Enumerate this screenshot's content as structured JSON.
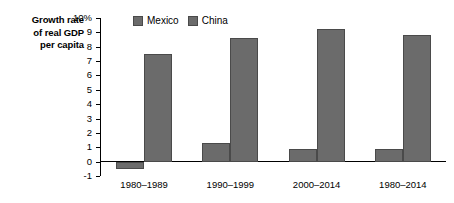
{
  "chart_data": {
    "type": "bar",
    "title": "",
    "ylabel": "Growth rate of real GDP per capita",
    "ylabel_lines": [
      "Growth rate",
      "of real GDP",
      "per capita"
    ],
    "xlabel": "",
    "categories": [
      "1980–1989",
      "1990–1999",
      "2000–2014",
      "1980–2014"
    ],
    "series": [
      {
        "name": "Mexico",
        "values": [
          -0.5,
          1.3,
          0.9,
          0.9
        ],
        "color": "#6b6b6b"
      },
      {
        "name": "China",
        "values": [
          7.5,
          8.6,
          9.2,
          8.8
        ],
        "color": "#6b6b6b"
      }
    ],
    "ylim": [
      -1,
      10
    ],
    "ytick_labels": [
      "10%",
      "9",
      "8",
      "7",
      "6",
      "5",
      "4",
      "3",
      "2",
      "1",
      "0",
      "-1"
    ],
    "ytick_values": [
      10,
      9,
      8,
      7,
      6,
      5,
      4,
      3,
      2,
      1,
      0,
      -1
    ],
    "grid": false,
    "legend_position": "top-center",
    "legend": [
      "Mexico",
      "China"
    ]
  }
}
